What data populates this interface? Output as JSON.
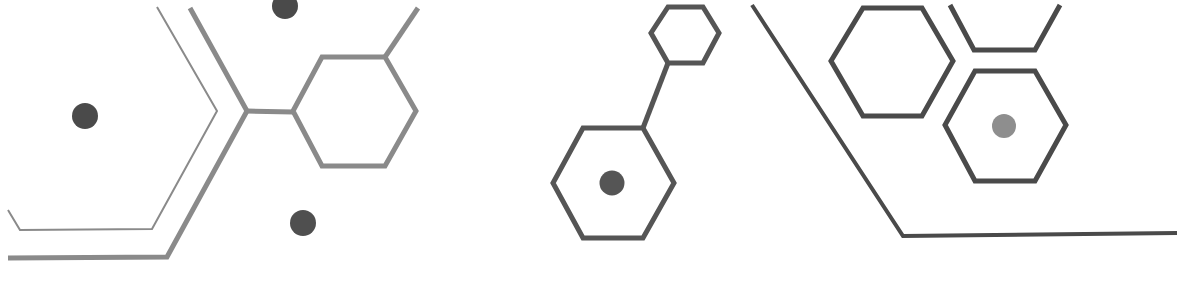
{
  "graphic": {
    "description": "Decorative molecular hexagon line-art pattern",
    "colors": {
      "background": "#ffffff",
      "line_light": "#8a8a8a",
      "line_dark": "#4a4a4a",
      "dot_dark": "#4a4a4a",
      "dot_light": "#8e8e8e"
    }
  }
}
